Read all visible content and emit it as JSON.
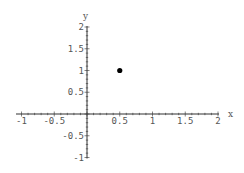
{
  "chart_data": {
    "type": "scatter",
    "title": "",
    "xlabel": "x",
    "ylabel": "y",
    "xlim": [
      -1,
      2
    ],
    "ylim": [
      -1,
      2
    ],
    "grid": false,
    "legend": null,
    "x_ticks": [
      -1,
      -0.5,
      0.5,
      1,
      1.5,
      2
    ],
    "x_tick_labels": [
      "-1",
      "-0.5",
      "0.5",
      "1",
      "1.5",
      "2"
    ],
    "y_ticks": [
      2,
      1.5,
      1,
      0.5,
      -0.5,
      -1
    ],
    "y_tick_labels": [
      "2",
      "1.5",
      "1",
      "0.5",
      "-0.5",
      "-1"
    ],
    "series": [
      {
        "name": "point",
        "x": [
          0.5
        ],
        "y": [
          1
        ],
        "color": "#000000"
      }
    ]
  },
  "colors": {
    "axis": "#333333",
    "text": "#555555",
    "point": "#000000",
    "background": "#ffffff"
  }
}
